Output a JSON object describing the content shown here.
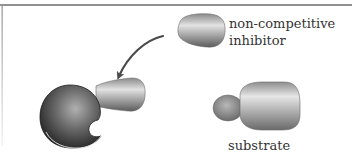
{
  "diagram": {
    "labels": {
      "inhibitor_line1": "non-competitive",
      "inhibitor_line2": "inhibitor",
      "substrate": "substrate"
    },
    "colors": {
      "border": "#707070",
      "text": "#333333",
      "enzyme_dark": "#2a2a2a",
      "enzyme_light": "#9a9a9a",
      "molecule_light": "#dcdcdc",
      "molecule_dark": "#6e6e6e",
      "arrow": "#4a4a4a"
    },
    "elements": [
      {
        "id": "enzyme",
        "shape": "sphere-with-cutout"
      },
      {
        "id": "bound-inhibitor",
        "shape": "blob"
      },
      {
        "id": "free-inhibitor",
        "shape": "blob"
      },
      {
        "id": "substrate",
        "shape": "knob-and-rounded-block"
      },
      {
        "id": "arrow",
        "shape": "curved-arrow",
        "from": "free-inhibitor",
        "to": "enzyme"
      }
    ]
  }
}
